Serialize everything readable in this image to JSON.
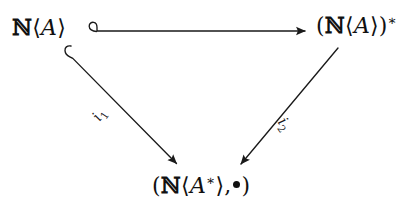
{
  "figure": {
    "kind": "commutative-diagram",
    "shape": "triangle",
    "background_color": "#ffffff",
    "ink_color": "#111111"
  },
  "nodes": {
    "source": {
      "id": "N<A>",
      "text": "ℕ⟨A⟩",
      "blackboard": "ℕ",
      "open_angle": "⟨",
      "variable": "A",
      "close_angle": "⟩",
      "position": "top-left"
    },
    "target_star": {
      "id": "(N<A>)*",
      "text": "(ℕ⟨A⟩)*",
      "open_paren": "(",
      "blackboard": "ℕ",
      "open_angle": "⟨",
      "variable": "A",
      "close_angle": "⟩",
      "close_paren": ")",
      "star": "∗",
      "position": "top-right"
    },
    "bottom": {
      "id": "(N<A*>,•)",
      "text": "(ℕ⟨A∗⟩, •)",
      "open_paren": "(",
      "blackboard": "ℕ",
      "open_angle": "⟨",
      "variable": "A",
      "star": "∗",
      "close_angle": "⟩",
      "comma": ",",
      "bullet": "•",
      "close_paren": ")",
      "position": "bottom-center"
    }
  },
  "edges": [
    {
      "name": "top-horizontal",
      "from": "source",
      "to": "target_star",
      "label": "",
      "style": "hooked-arrow",
      "head": "solid-triangle",
      "tail": "hook",
      "meaning": "inclusion"
    },
    {
      "name": "left-diagonal",
      "from": "source",
      "to": "bottom",
      "label_text": "i",
      "label_subscript": "1",
      "style": "hooked-arrow",
      "head": "solid-triangle",
      "tail": "hook",
      "meaning": "inclusion"
    },
    {
      "name": "right-diagonal",
      "from": "target_star",
      "to": "bottom",
      "label_text": "i",
      "label_subscript": "2",
      "style": "plain-arrow",
      "head": "solid-triangle",
      "tail": "none",
      "meaning": "induced morphism"
    }
  ]
}
